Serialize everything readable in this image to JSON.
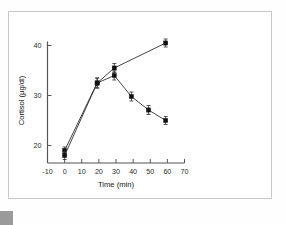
{
  "figure": {
    "frame_color": "#c9c9c9",
    "background": "#ffffff"
  },
  "chart_data": {
    "type": "line",
    "title": "",
    "subtitle": "",
    "xlabel": "Time (min)",
    "ylabel": "Cortisol (µg/dl)",
    "xlim": [
      -10,
      70
    ],
    "ylim": [
      16.5,
      41.5
    ],
    "xticks": [
      -10,
      0,
      10,
      20,
      30,
      40,
      50,
      60,
      70
    ],
    "xtick_labels": [
      "-10",
      "0",
      "10",
      "20",
      "30",
      "40",
      "50",
      "60",
      "70"
    ],
    "yticks": [
      20,
      30,
      40
    ],
    "ytick_labels": [
      "20",
      "30",
      "40"
    ],
    "grid": false,
    "legend": "none",
    "marker": "filled-square",
    "error_bars": "vertical",
    "line_color": "#303030",
    "marker_color": "#111111",
    "series": [
      {
        "name": "rising",
        "x": [
          0,
          19,
          29,
          59
        ],
        "values": [
          19.0,
          32.5,
          35.5,
          40.5
        ],
        "errors": [
          0.7,
          1.0,
          0.9,
          0.8
        ]
      },
      {
        "name": "peak-and-decline",
        "x": [
          0,
          19,
          29,
          39,
          49,
          59
        ],
        "values": [
          18.0,
          32.5,
          34.0,
          29.8,
          27.1,
          25.0
        ],
        "errors": [
          0.8,
          1.0,
          0.9,
          0.9,
          0.9,
          0.8
        ]
      }
    ]
  }
}
